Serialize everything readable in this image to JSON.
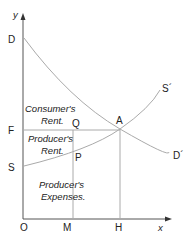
{
  "diagram": {
    "type": "supply-demand",
    "axes": {
      "x_label": "x",
      "y_label": "y",
      "origin_label": "O"
    },
    "points": {
      "D": "D",
      "F": "F",
      "S": "S",
      "A": "A",
      "Q": "Q",
      "P": "P",
      "M": "M",
      "H": "H",
      "S_prime": "S´",
      "D_prime": "D´"
    },
    "regions": {
      "consumer_line1": "Consumer's",
      "consumer_line2": "Rent.",
      "producer_rent_line1": "Producer's",
      "producer_rent_line2": "Rent.",
      "producer_exp_line1": "Producer's",
      "producer_exp_line2": "Expenses."
    },
    "colors": {
      "axis": "#555555",
      "curve": "#aaaaaa",
      "text": "#222222"
    }
  }
}
